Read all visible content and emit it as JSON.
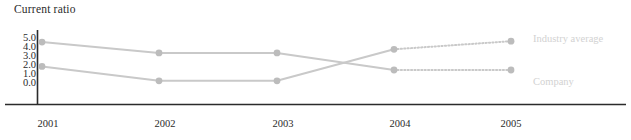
{
  "chart_data": {
    "type": "line",
    "title": "Current ratio",
    "xlabel": "",
    "ylabel": "",
    "categories": [
      "2001",
      "2002",
      "2003",
      "2004",
      "2005"
    ],
    "x": [
      2001,
      2002,
      2003,
      2004,
      2005
    ],
    "ylim": [
      0.0,
      5.0
    ],
    "yticks": [
      "5.0",
      "4.0",
      "3.0",
      "2.0",
      "1.0",
      "0.0"
    ],
    "ytick_values": [
      5.0,
      4.0,
      3.0,
      2.0,
      1.0,
      0.0
    ],
    "grid": false,
    "legend_position": "right-inline",
    "forecast_note": "segments from 2004 to 2005 are drawn dotted (projected)",
    "series": [
      {
        "name": "Company",
        "values": [
          4.6,
          3.4,
          3.4,
          1.5,
          1.5
        ],
        "dotted_from": "2004",
        "label_value": "1.5",
        "color": "#c9c9c9"
      },
      {
        "name": "Industry average",
        "values": [
          1.9,
          0.3,
          0.3,
          3.8,
          4.7
        ],
        "dotted_from": "2004",
        "label_value": "4.7",
        "color": "#c9c9c9"
      }
    ],
    "colors": {
      "line": "#c9c9c9",
      "marker": "#bcbcbc",
      "axis": "#2b2b2b",
      "title_text": "#2b2b2b",
      "tick_text": "#2b2b2b",
      "legend_text": "#d2d2d2",
      "background": "#ffffff"
    }
  },
  "legend": {
    "top_label": "Industry average",
    "bottom_label": "Company"
  }
}
